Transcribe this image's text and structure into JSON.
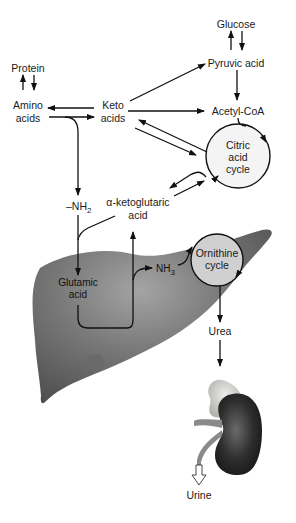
{
  "diagram": {
    "nodes": {
      "glucose": "Glucose",
      "pyruvic_acid": "Pyruvic acid",
      "protein": "Protein",
      "amino_acids_1": "Amino",
      "amino_acids_2": "acids",
      "keto_acids_1": "Keto",
      "keto_acids_2": "acids",
      "acetyl_coa": "Acetyl-CoA",
      "citric_1": "Citric",
      "citric_2": "acid",
      "citric_3": "cycle",
      "nh2": "–NH",
      "nh2_sub": "2",
      "alpha_keto_1": "α-ketoglutaric",
      "alpha_keto_2": "acid",
      "glutamic_1": "Glutamic",
      "glutamic_2": "acid",
      "nh3": "NH",
      "nh3_sub": "3",
      "ornithine_1": "Ornithine",
      "ornithine_2": "cycle",
      "urea": "Urea",
      "urine": "Urine"
    },
    "organs": [
      "liver",
      "kidney",
      "adrenal-gland"
    ],
    "colors": {
      "liver": "#6e6e6e",
      "liver_highlight": "#9a9a9a",
      "kidney": "#3a3a3a",
      "adrenal": "#d6d6d0",
      "ornithine_fill": "#cfcfcf",
      "citric_fill": "#f2f2f2",
      "line": "#111111"
    }
  }
}
